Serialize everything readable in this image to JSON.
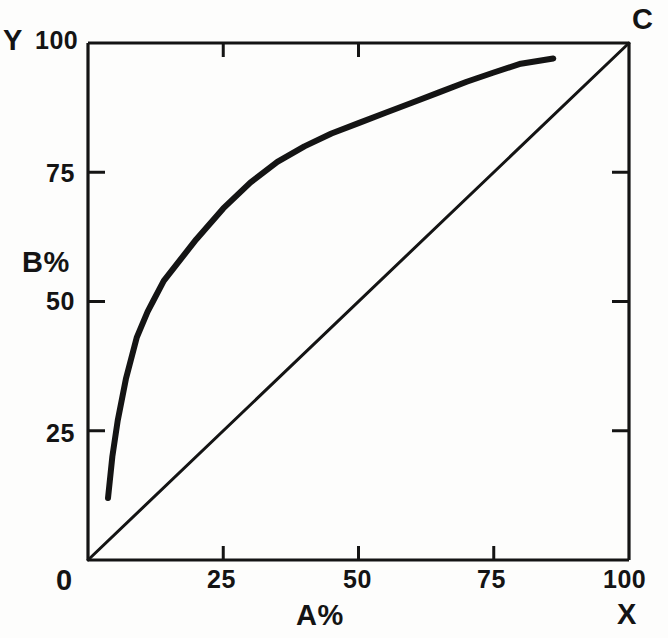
{
  "figure": {
    "background_color": "#fdfdfc",
    "ink_color": "#141414"
  },
  "labels": {
    "y_axis_title": "B%",
    "x_axis_title": "A%",
    "origin": "0",
    "y_axis_marker": "Y",
    "x_axis_marker": "X",
    "corner_marker": "C",
    "y_ticks": [
      "100",
      "75",
      "50",
      "25"
    ],
    "x_ticks": [
      "25",
      "50",
      "75",
      "100"
    ]
  },
  "chart_data": {
    "type": "line",
    "title": "",
    "xlabel": "A%",
    "ylabel": "B%",
    "xlim": [
      0,
      100
    ],
    "ylim": [
      0,
      100
    ],
    "xticks": [
      0,
      25,
      50,
      75,
      100
    ],
    "yticks": [
      0,
      25,
      50,
      75,
      100
    ],
    "grid": false,
    "legend": "none",
    "annotations": [
      {
        "text": "Y",
        "position": "top-left-outside",
        "meaning": "y-axis endpoint marker"
      },
      {
        "text": "C",
        "position": "top-right-outside",
        "meaning": "upper-right corner marker"
      },
      {
        "text": "X",
        "position": "bottom-right-outside",
        "meaning": "x-axis endpoint marker"
      },
      {
        "text": "0",
        "position": "bottom-left-outside",
        "meaning": "origin"
      }
    ],
    "series": [
      {
        "name": "enrichment-curve",
        "style": "thick-solid",
        "linewidth": 6,
        "x": [
          3.7,
          4.5,
          5.5,
          7,
          9,
          11,
          12,
          14,
          17,
          20,
          25,
          30,
          35,
          40,
          45,
          50,
          55,
          60,
          65,
          70,
          75,
          80,
          86
        ],
        "y": [
          12,
          20,
          27,
          35,
          43,
          48,
          50,
          54,
          58,
          62,
          68,
          73,
          77,
          80,
          82.5,
          84.5,
          86.5,
          88.5,
          90.5,
          92.5,
          94.3,
          96,
          97
        ]
      },
      {
        "name": "diagonal-reference-line",
        "style": "thin-solid",
        "linewidth": 3,
        "x": [
          0,
          100
        ],
        "y": [
          0,
          100
        ]
      }
    ]
  },
  "geometry": {
    "plot_left": 88,
    "plot_right": 629,
    "plot_top": 43,
    "plot_bottom": 560,
    "top_axis_tick_values": [
      25,
      50
    ],
    "right_axis_tick_values": [
      25,
      50,
      75
    ],
    "left_axis_tick_values": [
      25,
      50,
      75
    ],
    "bottom_axis_tick_values": [
      25,
      50,
      75
    ]
  }
}
